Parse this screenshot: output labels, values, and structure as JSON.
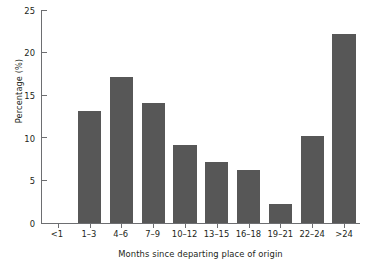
{
  "chart_data": {
    "type": "bar",
    "title": "",
    "subtitle": "",
    "xlabel": "Months since departing place of origin",
    "ylabel": "Percentage (%)",
    "categories": [
      "<1",
      "1–3",
      "4–6",
      "7–9",
      "10–12",
      "13–15",
      "16–18",
      "19–21",
      "22–24",
      ">24"
    ],
    "values": [
      0,
      13.1,
      17.1,
      14.1,
      9.2,
      7.2,
      6.2,
      2.2,
      10.2,
      22.2
    ],
    "series": [
      {
        "name": "Percentage",
        "values": [
          0,
          13.1,
          17.1,
          14.1,
          9.2,
          7.2,
          6.2,
          2.2,
          10.2,
          22.2
        ]
      }
    ],
    "ylim": [
      0,
      25
    ],
    "yticks": [
      0,
      5,
      10,
      15,
      20,
      25
    ],
    "ytick_labels": [
      "0",
      "5",
      "10",
      "15",
      "20",
      "25"
    ],
    "grid": false,
    "legend": false,
    "legend_position": "none",
    "bar_color": "#575757",
    "axis_color": "#6d6e71",
    "background": "#ffffff"
  }
}
